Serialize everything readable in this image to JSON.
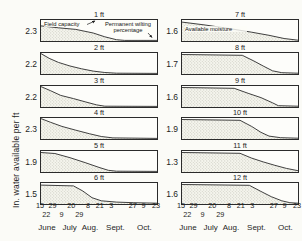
{
  "figure": {
    "ylabel": "In. water available per ft",
    "colors": {
      "line": "#2b2b2b",
      "stipple_dot": "#8f8f85",
      "background": "#fbfbf7",
      "text": "#1e1e1e"
    }
  },
  "chart_data": {
    "type": "area",
    "ylabel": "In. water available per ft",
    "x_axis": {
      "tick_row1": [
        {
          "label": "15",
          "f": 0.0
        },
        {
          "label": "29",
          "f": 0.108
        },
        {
          "label": "20",
          "f": 0.269
        },
        {
          "label": "8",
          "f": 0.415
        },
        {
          "label": "21",
          "f": 0.515
        },
        {
          "label": "3",
          "f": 0.615
        },
        {
          "label": "27",
          "f": 0.8
        },
        {
          "label": "9",
          "f": 0.892
        },
        {
          "label": "23",
          "f": 1.0
        }
      ],
      "tick_row2": [
        {
          "label": "22",
          "f": 0.054
        },
        {
          "label": "9",
          "f": 0.185
        },
        {
          "label": "29",
          "f": 0.338
        }
      ],
      "months": [
        {
          "label": "June",
          "f": 0.06
        },
        {
          "label": "July",
          "f": 0.255
        },
        {
          "label": "Aug.",
          "f": 0.43
        },
        {
          "label": "Sept.",
          "f": 0.65
        },
        {
          "label": "Oct.",
          "f": 0.9
        }
      ]
    },
    "columns": [
      {
        "panels": [
          {
            "depth_label": "1 ft",
            "value": "2.3",
            "points": [
              [
                0,
                0.72
              ],
              [
                0.15,
                0.63
              ],
              [
                0.3,
                0.55
              ],
              [
                0.45,
                0.38
              ],
              [
                0.55,
                0.2
              ],
              [
                0.65,
                0.06
              ],
              [
                0.72,
                0.03
              ],
              [
                1,
                0.03
              ]
            ],
            "annotations": [
              {
                "text": "Field capacity",
                "x": 3,
                "y": 1,
                "w": 42,
                "align": "left",
                "arrow": {
                  "x1": 46,
                  "y1": 4.5,
                  "x2": 54,
                  "y2": 1
                }
              },
              {
                "text": "Permanent wilting percentage",
                "x": 60,
                "y": 0.5,
                "w": 54,
                "align": "center",
                "arrow": {
                  "x1": 107,
                  "y1": 13,
                  "x2": 111,
                  "y2": 17.5
                }
              }
            ]
          },
          {
            "depth_label": "2 ft",
            "value": "2.2",
            "points": [
              [
                0,
                0.97
              ],
              [
                0.07,
                0.75
              ],
              [
                0.15,
                0.55
              ],
              [
                0.25,
                0.38
              ],
              [
                0.35,
                0.25
              ],
              [
                0.45,
                0.14
              ],
              [
                0.55,
                0.07
              ],
              [
                0.65,
                0.04
              ],
              [
                1,
                0.03
              ]
            ]
          },
          {
            "depth_label": "3 ft",
            "value": "2.2",
            "points": [
              [
                0,
                0.97
              ],
              [
                0.08,
                0.78
              ],
              [
                0.17,
                0.55
              ],
              [
                0.28,
                0.4
              ],
              [
                0.38,
                0.25
              ],
              [
                0.48,
                0.1
              ],
              [
                0.55,
                0.04
              ],
              [
                1,
                0.03
              ]
            ]
          },
          {
            "depth_label": "4 ft",
            "value": "2.3",
            "points": [
              [
                0,
                0.97
              ],
              [
                0.08,
                0.8
              ],
              [
                0.18,
                0.6
              ],
              [
                0.3,
                0.42
              ],
              [
                0.42,
                0.25
              ],
              [
                0.52,
                0.12
              ],
              [
                0.62,
                0.05
              ],
              [
                1,
                0.03
              ]
            ]
          },
          {
            "depth_label": "5 ft",
            "value": "1.9",
            "points": [
              [
                0,
                0.93
              ],
              [
                0.12,
                0.88
              ],
              [
                0.25,
                0.68
              ],
              [
                0.38,
                0.45
              ],
              [
                0.5,
                0.22
              ],
              [
                0.58,
                0.08
              ],
              [
                0.65,
                0.04
              ],
              [
                1,
                0.03
              ]
            ]
          },
          {
            "depth_label": "6 ft",
            "value": "1.5",
            "points": [
              [
                0,
                0.9
              ],
              [
                0.28,
                0.86
              ],
              [
                0.36,
                0.62
              ],
              [
                0.44,
                0.3
              ],
              [
                0.52,
                0.15
              ],
              [
                0.65,
                0.09
              ],
              [
                0.8,
                0.06
              ],
              [
                1,
                0.04
              ]
            ]
          }
        ]
      },
      {
        "panels": [
          {
            "depth_label": "7 ft",
            "value": "1.6",
            "points": [
              [
                0,
                0.9
              ],
              [
                0.2,
                0.76
              ],
              [
                0.4,
                0.6
              ],
              [
                0.6,
                0.42
              ],
              [
                0.75,
                0.27
              ],
              [
                0.88,
                0.12
              ],
              [
                1,
                0.04
              ]
            ],
            "annotations": [
              {
                "text": "Available moisture",
                "x": 3,
                "y": 6,
                "w": 62,
                "align": "left"
              }
            ]
          },
          {
            "depth_label": "8 ft",
            "value": "1.7",
            "points": [
              [
                0,
                0.93
              ],
              [
                0.52,
                0.89
              ],
              [
                0.62,
                0.62
              ],
              [
                0.7,
                0.38
              ],
              [
                0.78,
                0.15
              ],
              [
                0.86,
                0.06
              ],
              [
                1,
                0.04
              ]
            ]
          },
          {
            "depth_label": "9 ft",
            "value": "1.6",
            "points": [
              [
                0,
                0.93
              ],
              [
                0.45,
                0.89
              ],
              [
                0.57,
                0.65
              ],
              [
                0.68,
                0.45
              ],
              [
                0.78,
                0.2
              ],
              [
                0.83,
                0.06
              ],
              [
                1,
                0.04
              ]
            ]
          },
          {
            "depth_label": "10 ft",
            "value": "1.9",
            "points": [
              [
                0,
                0.93
              ],
              [
                0.5,
                0.89
              ],
              [
                0.6,
                0.6
              ],
              [
                0.68,
                0.32
              ],
              [
                0.75,
                0.14
              ],
              [
                0.85,
                0.06
              ],
              [
                1,
                0.04
              ]
            ]
          },
          {
            "depth_label": "11 ft",
            "value": "1.3",
            "points": [
              [
                0,
                0.93
              ],
              [
                0.5,
                0.89
              ],
              [
                0.6,
                0.66
              ],
              [
                0.7,
                0.48
              ],
              [
                0.8,
                0.32
              ],
              [
                0.9,
                0.17
              ],
              [
                1,
                0.06
              ]
            ]
          },
          {
            "depth_label": "12 ft",
            "value": "1.6",
            "points": [
              [
                0,
                0.93
              ],
              [
                0.58,
                0.89
              ],
              [
                0.68,
                0.6
              ],
              [
                0.77,
                0.35
              ],
              [
                0.86,
                0.15
              ],
              [
                0.93,
                0.06
              ],
              [
                1,
                0.04
              ]
            ]
          }
        ]
      }
    ]
  }
}
